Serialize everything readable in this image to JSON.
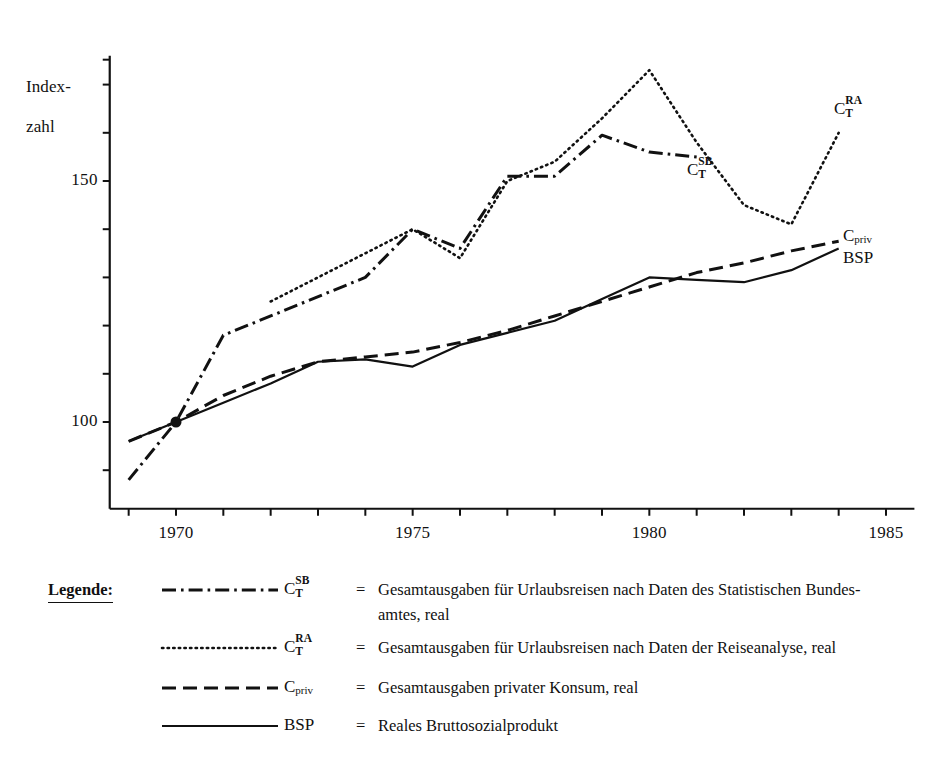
{
  "chart_data": {
    "type": "line",
    "title": "",
    "xlabel": "",
    "ylabel": "Index-\nzahl",
    "ylabel_line1": "Index-",
    "ylabel_line2": "zahl",
    "xlim": [
      1968.6,
      1985.6
    ],
    "ylim": [
      82,
      176
    ],
    "grid": false,
    "legend_position": "below",
    "x_tick_labels": [
      "1970",
      "1975",
      "1980",
      "1985"
    ],
    "x_tick_values": [
      1970,
      1975,
      1980,
      1985
    ],
    "x_minor_ticks": [
      1969,
      1971,
      1972,
      1973,
      1974,
      1976,
      1977,
      1978,
      1979,
      1981,
      1982,
      1983,
      1984
    ],
    "y_tick_labels": [
      "100",
      "150"
    ],
    "y_tick_values": [
      100,
      150
    ],
    "y_minor_ticks": [
      90,
      110,
      120,
      130,
      140,
      160,
      170
    ],
    "series": [
      {
        "name": "C_T^SB",
        "label_html": "C<sup>SB</sup><sub>T</sub>",
        "style": "dash-dot",
        "x": [
          1969,
          1970,
          1971,
          1974,
          1975,
          1976,
          1977,
          1978,
          1979,
          1980,
          1981
        ],
        "values": [
          88,
          100,
          118,
          130,
          140,
          136,
          151,
          151,
          159.5,
          156,
          155
        ],
        "annotation": "C_T^SB",
        "annotation_x": 1980.6,
        "annotation_y": 152
      },
      {
        "name": "C_T^RA",
        "label_html": "C<sup>RA</sup><sub>T</sub>",
        "style": "dotted",
        "x": [
          1972,
          1975,
          1976,
          1977,
          1978,
          1979,
          1980,
          1981,
          1982,
          1983,
          1984
        ],
        "values": [
          125,
          140,
          134,
          150,
          154,
          163,
          173,
          158,
          145,
          141,
          160
        ],
        "annotation": "C_T^RA",
        "annotation_x": 1984.1,
        "annotation_y": 164
      },
      {
        "name": "C_priv",
        "label_html": "C<sub>priv</sub>",
        "style": "dashed",
        "x": [
          1969,
          1970,
          1971,
          1972,
          1973,
          1974,
          1975,
          1976,
          1977,
          1978,
          1979,
          1980,
          1981,
          1982,
          1983,
          1984
        ],
        "values": [
          96,
          100,
          105.5,
          109.5,
          112.5,
          113.5,
          114.5,
          116.5,
          119,
          122,
          125,
          128,
          131,
          133,
          135.5,
          137.5
        ],
        "annotation": "C_priv",
        "annotation_x": 1984.2,
        "annotation_y": 139
      },
      {
        "name": "BSP",
        "label_html": "BSP",
        "style": "solid",
        "x": [
          1969,
          1970,
          1971,
          1972,
          1973,
          1974,
          1975,
          1976,
          1977,
          1978,
          1979,
          1980,
          1981,
          1982,
          1983,
          1984
        ],
        "values": [
          96,
          100,
          104,
          108,
          112.5,
          113,
          111.5,
          116,
          118.5,
          121,
          125.5,
          130,
          129.5,
          129,
          131.5,
          136
        ],
        "annotation": "BSP",
        "annotation_x": 1984.2,
        "annotation_y": 134
      }
    ],
    "base_marker": {
      "x": 1970,
      "y": 100,
      "note": "common index base point"
    }
  },
  "annotations": {
    "ct_sb": {
      "base": "C",
      "sup": "SB",
      "sub": "T"
    },
    "ct_ra": {
      "base": "C",
      "sup": "RA",
      "sub": "T"
    },
    "c_priv": {
      "base": "C",
      "sub": "priv"
    },
    "bsp": "BSP"
  },
  "legend": {
    "title": "Legende:",
    "rows": [
      {
        "key_base": "C",
        "key_sup": "SB",
        "key_sub": "T",
        "equals": "=",
        "text": "Gesamtausgaben für Urlaubsreisen nach Daten des Statistischen Bundes-",
        "text2": "amtes, real",
        "style": "dash-dot"
      },
      {
        "key_base": "C",
        "key_sup": "RA",
        "key_sub": "T",
        "equals": "=",
        "text": "Gesamtausgaben für Urlaubsreisen nach Daten der Reiseanalyse, real",
        "text2": "",
        "style": "dotted"
      },
      {
        "key_base": "C",
        "key_sup": "",
        "key_sub": "priv",
        "equals": "=",
        "text": "Gesamtausgaben privater Konsum, real",
        "text2": "",
        "style": "dashed"
      },
      {
        "key_base": "BSP",
        "key_sup": "",
        "key_sub": "",
        "equals": "=",
        "text": "Reales Bruttosozialprodukt",
        "text2": "",
        "style": "solid"
      }
    ]
  },
  "colors": {
    "ink": "#111111",
    "background": "#ffffff"
  }
}
